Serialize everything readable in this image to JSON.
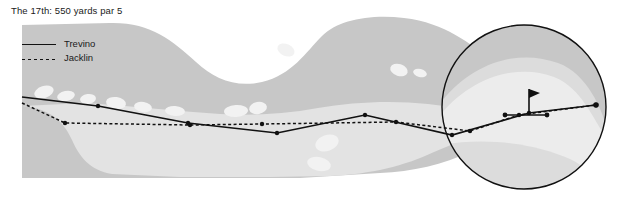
{
  "figure": {
    "title": "The 17th: 550 yards par 5",
    "type": "golf-hole-diagram"
  },
  "legend": {
    "items": [
      {
        "label": "Trevino",
        "key": "solid",
        "color": "#111111"
      },
      {
        "label": "Jacklin",
        "key": "dash",
        "color": "#111111"
      }
    ]
  },
  "colors": {
    "background": "#ffffff",
    "rough": "#c7c7c7",
    "fairway": "#e3e3e3",
    "green_outer": "#dcdcdc",
    "green_inner": "#ececec",
    "bunker": "#f2f2f2",
    "line": "#111111",
    "circle_outline": "#111111"
  },
  "chart_data": {
    "type": "line",
    "title": "The 17th: 550 yards par 5",
    "xlabel": "",
    "ylabel": "",
    "grid": false,
    "legend_position": "top-left",
    "xlim": [
      0,
      623
    ],
    "ylim": [
      203,
      0
    ],
    "annotations": [
      {
        "name": "magnifier-circle",
        "cx": 524,
        "cy": 107,
        "r": 82
      },
      {
        "name": "flag-pin",
        "x": 529,
        "y": 113
      },
      {
        "name": "hole",
        "x": 596,
        "y": 105
      }
    ],
    "series": [
      {
        "name": "Trevino",
        "style": "solid",
        "points": [
          [
            22,
            97
          ],
          [
            98,
            106
          ],
          [
            188,
            123
          ],
          [
            277,
            133
          ],
          [
            365,
            115
          ],
          [
            452,
            135
          ],
          [
            529,
            113
          ],
          [
            596,
            105
          ]
        ]
      },
      {
        "name": "Jacklin",
        "style": "dashed",
        "points": [
          [
            22,
            103
          ],
          [
            65,
            123
          ],
          [
            190,
            125
          ],
          [
            262,
            124
          ],
          [
            396,
            122
          ],
          [
            470,
            131
          ],
          [
            519,
            115
          ],
          [
            596,
            105
          ]
        ]
      }
    ]
  },
  "course": {
    "rough_outline": "M 22,25 L 110,23 C 150,22 172,40 196,62 C 214,79 236,88 262,82 C 292,75 306,52 322,36 C 338,20 370,14 404,18 C 446,23 470,44 492,60 C 516,78 550,86 580,88 L 601,89 L 601,131 L 560,131 C 520,131 496,140 470,152 C 444,164 412,172 380,173 L 300,178 L 220,178 L 140,178 L 22,178 Z",
    "fairway_outline": "M 22,106 C 50,108 64,122 72,140 C 80,158 90,170 112,174 L 180,177 L 270,177 L 330,176 C 372,174 404,166 434,152 C 460,140 488,132 520,130 L 601,129 L 601,112 L 540,112 C 500,112 462,108 428,104 C 392,100 352,102 318,108 C 286,114 252,116 220,114 C 176,111 130,106 86,103 Z",
    "bunkers": [
      {
        "cx": 44,
        "cy": 92,
        "rx": 10,
        "ry": 6,
        "rot": -18
      },
      {
        "cx": 66,
        "cy": 96,
        "rx": 9,
        "ry": 5,
        "rot": -12
      },
      {
        "cx": 88,
        "cy": 99,
        "rx": 8,
        "ry": 5,
        "rot": -8
      },
      {
        "cx": 116,
        "cy": 103,
        "rx": 10,
        "ry": 6,
        "rot": 8
      },
      {
        "cx": 143,
        "cy": 107,
        "rx": 9,
        "ry": 5,
        "rot": 10
      },
      {
        "cx": 175,
        "cy": 111,
        "rx": 10,
        "ry": 5,
        "rot": 4
      },
      {
        "cx": 236,
        "cy": 111,
        "rx": 12,
        "ry": 6,
        "rot": -4
      },
      {
        "cx": 258,
        "cy": 108,
        "rx": 9,
        "ry": 6,
        "rot": -10
      },
      {
        "cx": 286,
        "cy": 50,
        "rx": 9,
        "ry": 6,
        "rot": 24
      },
      {
        "cx": 399,
        "cy": 70,
        "rx": 9,
        "ry": 6,
        "rot": 18
      },
      {
        "cx": 420,
        "cy": 73,
        "rx": 7,
        "ry": 4,
        "rot": 14
      },
      {
        "cx": 327,
        "cy": 143,
        "rx": 12,
        "ry": 8,
        "rot": -20
      },
      {
        "cx": 319,
        "cy": 164,
        "rx": 12,
        "ry": 7,
        "rot": 12
      }
    ]
  }
}
